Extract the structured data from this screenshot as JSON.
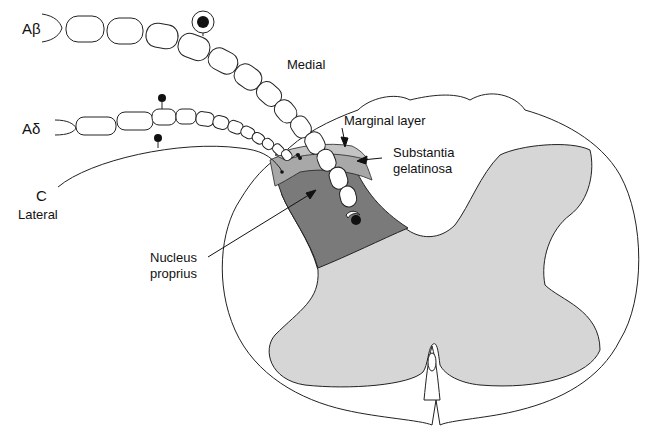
{
  "diagram": {
    "fibers": [
      {
        "id": "abeta",
        "label": "Aβ"
      },
      {
        "id": "adelta",
        "label": "Aδ"
      },
      {
        "id": "c",
        "label": "C"
      }
    ],
    "orientation": {
      "medial": "Medial",
      "lateral": "Lateral"
    },
    "regions": {
      "marginal_layer": "Marginal layer",
      "substantia_gelatinosa_line1": "Substantia",
      "substantia_gelatinosa_line2": "gelatinosa",
      "nucleus_proprius_line1": "Nucleus",
      "nucleus_proprius_line2": "proprius"
    },
    "colors": {
      "white_matter": "#ffffff",
      "gray_matter": "#d6d6d6",
      "nucleus_proprius": "#7a7a7a",
      "substantia_gelatinosa": "#a8a8a8",
      "marginal_layer": "#c4c4c4",
      "outline": "#222222"
    }
  }
}
